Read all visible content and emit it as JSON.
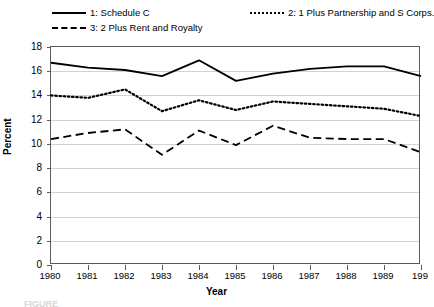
{
  "chart_data": {
    "type": "line",
    "title": "",
    "xlabel": "Year",
    "ylabel": "Percent",
    "categories": [
      "1980",
      "1981",
      "1982",
      "1983",
      "1984",
      "1985",
      "1986",
      "1987",
      "1988",
      "1989",
      "1990"
    ],
    "x_tick_labels": [
      "1980",
      "1981",
      "1982",
      "1983",
      "1984",
      "1985",
      "1986",
      "1987",
      "1988",
      "1989",
      "199"
    ],
    "y_ticks": [
      0,
      2,
      4,
      6,
      8,
      10,
      12,
      14,
      16,
      18
    ],
    "ylim": [
      0,
      18
    ],
    "grid": "horizontal",
    "legend_position": "above-plot",
    "series": [
      {
        "name": "1: Schedule C",
        "style": "solid",
        "values": [
          16.7,
          16.3,
          16.1,
          15.6,
          16.9,
          15.2,
          15.8,
          16.2,
          16.4,
          16.4,
          15.6
        ]
      },
      {
        "name": "2: 1 Plus Partnership and S Corps.",
        "style": "dotted",
        "values": [
          14.0,
          13.8,
          14.5,
          12.7,
          13.6,
          12.8,
          13.5,
          13.3,
          13.1,
          12.9,
          12.3
        ]
      },
      {
        "name": "3: 2 Plus Rent and Royalty",
        "style": "dashed",
        "values": [
          10.4,
          10.9,
          11.2,
          9.1,
          11.1,
          9.9,
          11.5,
          10.5,
          10.4,
          10.4,
          9.3
        ]
      }
    ]
  },
  "legend": {
    "items": [
      {
        "label": "1: Schedule C"
      },
      {
        "label": "2: 1 Plus Partnership and S Corps."
      },
      {
        "label": "3: 2 Plus Rent and Royalty"
      }
    ]
  },
  "caption": "FIGURE"
}
